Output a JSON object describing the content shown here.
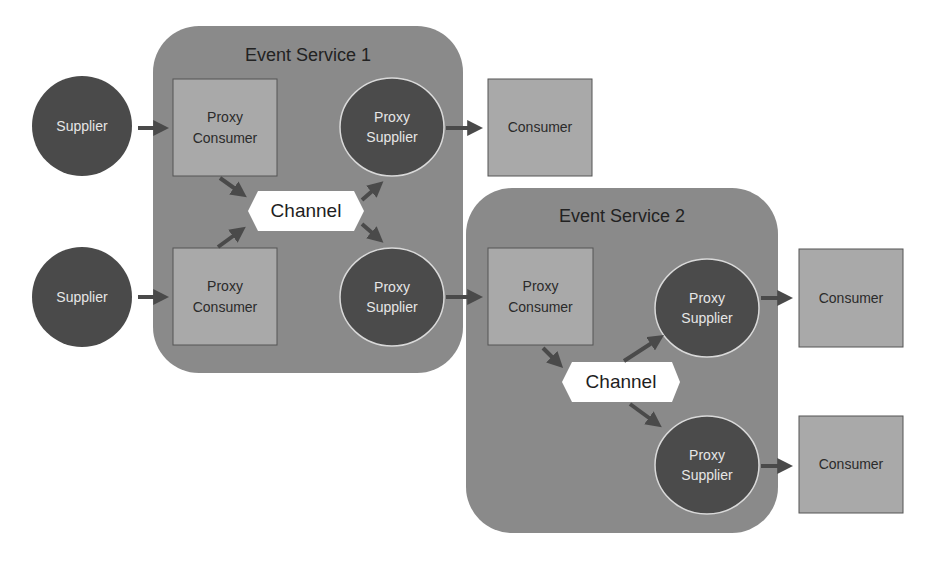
{
  "colors": {
    "background": "#ffffff",
    "service_box": "#8a8a8a",
    "supplier_fill": "#4a4a4a",
    "proxy_supplier_fill": "#4b4b4b",
    "proxy_supplier_stroke": "#d9d9d9",
    "square_fill": "#a9a9a9",
    "square_stroke": "#555555",
    "channel_fill": "#ffffff",
    "arrow": "#4a4a4a"
  },
  "services": [
    {
      "title": "Event Service 1"
    },
    {
      "title": "Event Service 2"
    }
  ],
  "suppliers": [
    {
      "label": "Supplier"
    },
    {
      "label": "Supplier"
    }
  ],
  "service1": {
    "proxy_consumers": [
      {
        "label": "Proxy\nConsumer"
      },
      {
        "label": "Proxy\nConsumer"
      }
    ],
    "channel": {
      "label": "Channel"
    },
    "proxy_suppliers": [
      {
        "label": "Proxy\nSupplier"
      },
      {
        "label": "Proxy\nSupplier"
      }
    ]
  },
  "service2": {
    "proxy_consumer": {
      "label": "Proxy\nConsumer"
    },
    "channel": {
      "label": "Channel"
    },
    "proxy_suppliers": [
      {
        "label": "Proxy\nSupplier"
      },
      {
        "label": "Proxy\nSupplier"
      }
    ]
  },
  "consumers": [
    {
      "label": "Consumer"
    },
    {
      "label": "Consumer"
    },
    {
      "label": "Consumer"
    }
  ]
}
